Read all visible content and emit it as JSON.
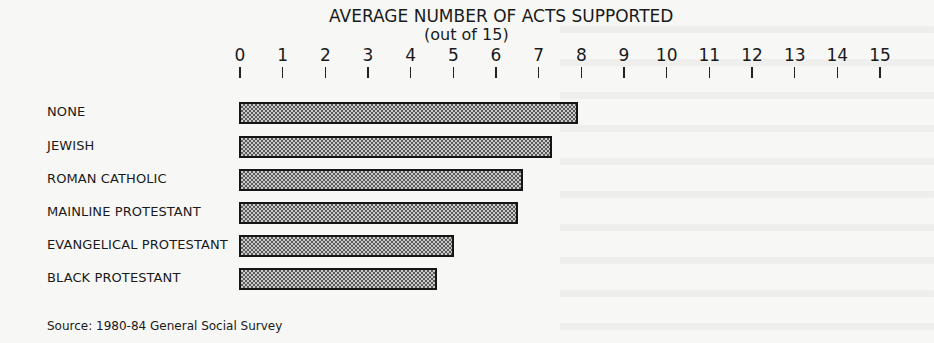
{
  "chart_data": {
    "type": "bar",
    "orientation": "horizontal",
    "title": "AVERAGE NUMBER OF ACTS SUPPORTED",
    "subtitle": "(out of 15)",
    "xlabel": "",
    "ylabel": "",
    "xlim": [
      0,
      15
    ],
    "x_ticks": [
      "0",
      "1",
      "2",
      "3",
      "4",
      "5",
      "6",
      "7",
      "8",
      "9",
      "10",
      "11",
      "12",
      "13",
      "14",
      "15"
    ],
    "grid": false,
    "legend": null,
    "categories": [
      "NONE",
      "JEWISH",
      "ROMAN CATHOLIC",
      "MAINLINE PROTESTANT",
      "EVANGELICAL PROTESTANT",
      "BLACK PROTESTANT"
    ],
    "values": [
      7.9,
      7.3,
      6.6,
      6.5,
      5.0,
      4.6
    ],
    "source": "Source: 1980-84  General Social Survey"
  },
  "layout": {
    "axis_x0_px": 240,
    "px_per_unit": 42.67,
    "bar_tops_px": [
      102,
      136,
      169,
      202,
      235,
      268
    ],
    "label_tops_px": [
      104,
      138,
      171,
      204,
      237,
      270
    ]
  }
}
